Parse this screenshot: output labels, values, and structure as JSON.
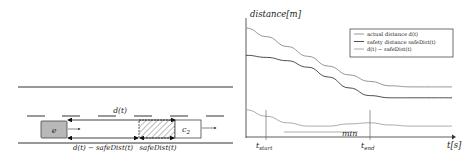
{
  "scene": {
    "ego_vehicle_label": "e",
    "other_vehicle_label": "c",
    "other_vehicle_subscript": "2",
    "distance_label": "d(t)",
    "gap_label": "d(t) − safeDist(t)",
    "safe_label": "safeDist(t)"
  },
  "chart": {
    "ylabel": "distance[m]",
    "xlabel": "t[s]",
    "t_start_label": "t",
    "t_start_sub": "start",
    "t_end_label": "t",
    "t_end_sub": "end",
    "min_label": "min",
    "legend": [
      {
        "label": "actual distance d(t)",
        "color": "#8a8a8a"
      },
      {
        "label": "safety distance safeDist(t)",
        "color": "#3a3a3a"
      },
      {
        "label": "d(t) − safeDist(t)",
        "color": "#a0a0a0"
      }
    ]
  },
  "chart_data": {
    "type": "line",
    "title": "",
    "xlabel": "t[s]",
    "ylabel": "distance[m]",
    "x": [
      0,
      10,
      20,
      30,
      40,
      50,
      60,
      70,
      80,
      90,
      100
    ],
    "series": [
      {
        "name": "actual distance d(t)",
        "values": [
          100,
          92,
          83,
          74,
          65,
          57,
          51,
          47,
          46,
          46,
          46
        ]
      },
      {
        "name": "safety distance safeDist(t)",
        "values": [
          75,
          73,
          70,
          64,
          55,
          45,
          38,
          36,
          36,
          36,
          36
        ]
      },
      {
        "name": "d(t) − safeDist(t)",
        "values": [
          25,
          19,
          13,
          10,
          10,
          12,
          13,
          11,
          10,
          10,
          10
        ]
      }
    ],
    "annotations": [
      "t_start",
      "t_end",
      "min"
    ],
    "grid": false,
    "legend_position": "upper right"
  }
}
